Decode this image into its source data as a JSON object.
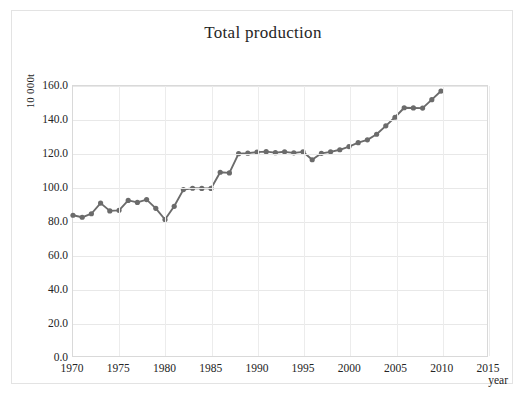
{
  "chart_data": {
    "type": "line",
    "title": "Total production",
    "xlabel": "year",
    "ylabel": "10 000t",
    "xlim": [
      1970,
      2015
    ],
    "ylim": [
      0.0,
      160.0
    ],
    "grid": true,
    "legend": "none",
    "marker": "circle",
    "series_color": "#6b6b6b",
    "x_ticks": [
      "1970",
      "1975",
      "1980",
      "1985",
      "1990",
      "1995",
      "2000",
      "2005",
      "2010",
      "2015"
    ],
    "x_tick_values": [
      1970,
      1975,
      1980,
      1985,
      1990,
      1995,
      2000,
      2005,
      2010,
      2015
    ],
    "y_ticks": [
      "0.0",
      "20.0",
      "40.0",
      "60.0",
      "80.0",
      "100.0",
      "120.0",
      "140.0",
      "160.0"
    ],
    "y_tick_values": [
      0.0,
      20.0,
      40.0,
      60.0,
      80.0,
      100.0,
      120.0,
      140.0,
      160.0
    ],
    "x": [
      1970,
      1971,
      1972,
      1973,
      1974,
      1975,
      1976,
      1977,
      1978,
      1979,
      1980,
      1981,
      1982,
      1983,
      1984,
      1985,
      1986,
      1987,
      1988,
      1989,
      1990,
      1991,
      1992,
      1993,
      1994,
      1995,
      1996,
      1997,
      1998,
      1999,
      2000,
      2001,
      2002,
      2003,
      2004,
      2005,
      2006,
      2007,
      2008,
      2009,
      2010
    ],
    "values": [
      83.4,
      82.2,
      84.3,
      90.6,
      86.0,
      86.3,
      92.2,
      91.0,
      92.7,
      87.5,
      80.9,
      88.7,
      98.6,
      99.4,
      99.3,
      99.3,
      108.9,
      108.5,
      119.9,
      120.2,
      120.8,
      121.1,
      120.5,
      121.0,
      120.4,
      121.0,
      116.3,
      120.1,
      121.0,
      122.2,
      124.1,
      126.4,
      128.1,
      131.4,
      136.4,
      141.5,
      147.1,
      147.0,
      146.9,
      151.9,
      157.0
    ],
    "series_name": "Total production"
  },
  "axes": {
    "y_caption": "10 000t",
    "x_caption": "year"
  },
  "title": "Total production"
}
